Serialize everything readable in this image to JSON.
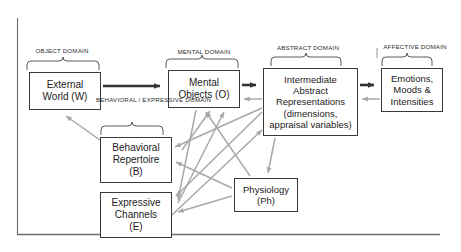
{
  "figure": {
    "frame_color": "#555555",
    "box_border_color": "#3a3a3a",
    "primary_arrow_color": "#333333",
    "secondary_arrow_color": "#a8a8a8",
    "brace_color": "#555555"
  },
  "domain_labels": {
    "object": "OBJECT DOMAIN",
    "mental": "MENTAL DOMAIN",
    "abstract": "ABSTRACT DOMAIN",
    "affective": "AFFECTIVE  DOMAIN",
    "behavioral_expressive_line1": "BEHAVIORAL /",
    "behavioral_expressive_line2": "EXPRESSIVE",
    "behavioral_expressive_line3": "DOMAIN"
  },
  "nodes": {
    "external_world": {
      "line1": "External",
      "line2": "World (W)"
    },
    "mental_objects": {
      "line1": "Mental",
      "line2": "Objects (O)"
    },
    "abstract_representations": {
      "line1": "Intermediate",
      "line2": "Abstract",
      "line3": "Representations",
      "line4": "(dimensions,",
      "line5": "appraisal variables)"
    },
    "emotions": {
      "line1": "Emotions,",
      "line2": "Moods &",
      "line3": "Intensities"
    },
    "behavioral_repertoire": {
      "line1": "Behavioral",
      "line2": "Repertoire",
      "line3": "(B)"
    },
    "expressive_channels": {
      "line1": "Expressive",
      "line2": "Channels",
      "line3": "(E)"
    },
    "physiology": {
      "line1": "Physiology",
      "line2": "(Ph)"
    }
  }
}
